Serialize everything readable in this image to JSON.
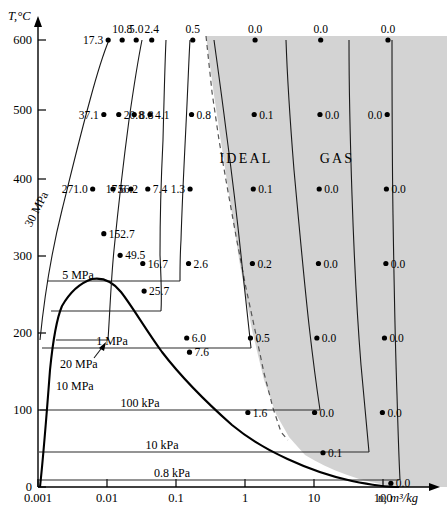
{
  "chart_data": {
    "type": "line",
    "title": "",
    "xlabel": "υ, m³/kg",
    "ylabel": "T,°C",
    "xscale": "log",
    "xlim": [
      0.001,
      300
    ],
    "ylim": [
      0,
      640
    ],
    "grid": false,
    "legend": "none",
    "x_ticks": [
      "0.001",
      "0.01",
      "0.1",
      "1",
      "10",
      "100"
    ],
    "y_ticks": [
      "0",
      "100",
      "200",
      "300",
      "400",
      "500",
      "600"
    ],
    "region_labels": [
      {
        "text": "IDEAL",
        "x": 3.2,
        "y": 440
      },
      {
        "text": "GAS",
        "x": 22,
        "y": 440
      }
    ],
    "shaded_region_note": "ideal-gas region shading",
    "isobar_labels": [
      {
        "text": "30 MPa",
        "rotated": true
      },
      {
        "text": "20 MPa",
        "rotated": false
      },
      {
        "text": "10 MPa",
        "rotated": false
      },
      {
        "text": "5 MPa",
        "rotated": false
      },
      {
        "text": "1 MPa",
        "rotated": false
      },
      {
        "text": "100 kPa",
        "rotated": false
      },
      {
        "text": "10 kPa",
        "rotated": false
      },
      {
        "text": "0.8 kPa",
        "rotated": false
      }
    ],
    "series": [
      {
        "name": "30 MPa",
        "values": [
          "17.3",
          "37.1",
          "271.0"
        ]
      },
      {
        "name": "20 MPa",
        "values": [
          "10.8",
          "20.8",
          "56.2",
          "152.7"
        ]
      },
      {
        "name": "10 MPa",
        "values": [
          "5.0",
          "8.8",
          "17.6",
          "49.5"
        ]
      },
      {
        "name": "5 MPa",
        "values": [
          "2.4",
          "4.1",
          "7.4",
          "16.7",
          "25.7"
        ]
      },
      {
        "name": "1 MPa",
        "values": [
          "0.5",
          "0.8",
          "1.3",
          "2.6",
          "6.0",
          "7.6"
        ]
      },
      {
        "name": "100 kPa",
        "values": [
          "0.0",
          "0.1",
          "0.1",
          "0.2",
          "0.5",
          "1.6"
        ]
      },
      {
        "name": "10 kPa",
        "values": [
          "0.0",
          "0.0",
          "0.0",
          "0.0",
          "0.0",
          "0.0",
          "0.1"
        ]
      },
      {
        "name": "0.8 kPa",
        "values": [
          "0.0",
          "0.0",
          "0.0",
          "0.0",
          "0.0",
          "0.0",
          "0.0"
        ]
      }
    ],
    "data_points": [
      {
        "label": "17.3",
        "x": 0.0104,
        "y": 600,
        "anchor": "end"
      },
      {
        "label": "10.8",
        "x": 0.0166,
        "y": 600,
        "anchor": "middle"
      },
      {
        "label": "5.0",
        "x": 0.0265,
        "y": 600,
        "anchor": "middle"
      },
      {
        "label": "2.4",
        "x": 0.0445,
        "y": 600,
        "anchor": "middle"
      },
      {
        "label": "0.5",
        "x": 0.175,
        "y": 600,
        "anchor": "middle"
      },
      {
        "label": "0.0",
        "x": 1.4,
        "y": 600,
        "anchor": "middle"
      },
      {
        "label": "0.0",
        "x": 12.5,
        "y": 600,
        "anchor": "middle"
      },
      {
        "label": "0.0",
        "x": 118,
        "y": 600,
        "anchor": "middle"
      },
      {
        "label": "37.1",
        "x": 0.009,
        "y": 500,
        "anchor": "end"
      },
      {
        "label": "20.8",
        "x": 0.0148,
        "y": 500,
        "anchor": "start"
      },
      {
        "label": "8.8",
        "x": 0.0248,
        "y": 500,
        "anchor": "start"
      },
      {
        "label": "4.1",
        "x": 0.042,
        "y": 500,
        "anchor": "start"
      },
      {
        "label": "0.8",
        "x": 0.168,
        "y": 500,
        "anchor": "start"
      },
      {
        "label": "0.1",
        "x": 1.36,
        "y": 500,
        "anchor": "start"
      },
      {
        "label": "0.0",
        "x": 12.2,
        "y": 500,
        "anchor": "start"
      },
      {
        "label": "0.0",
        "x": 115,
        "y": 500,
        "anchor": "end"
      },
      {
        "label": "271.0",
        "x": 0.0062,
        "y": 400,
        "anchor": "end"
      },
      {
        "label": "56.2",
        "x": 0.0122,
        "y": 400,
        "anchor": "start"
      },
      {
        "label": "17.6",
        "x": 0.0222,
        "y": 400,
        "anchor": "end"
      },
      {
        "label": "7.4",
        "x": 0.039,
        "y": 400,
        "anchor": "start"
      },
      {
        "label": "1.3",
        "x": 0.16,
        "y": 400,
        "anchor": "end"
      },
      {
        "label": "0.1",
        "x": 1.32,
        "y": 400,
        "anchor": "start"
      },
      {
        "label": "0.0",
        "x": 11.9,
        "y": 400,
        "anchor": "start"
      },
      {
        "label": "0.0",
        "x": 112,
        "y": 400,
        "anchor": "start"
      },
      {
        "label": "152.7",
        "x": 0.009,
        "y": 340,
        "anchor": "start"
      },
      {
        "label": "49.5",
        "x": 0.0155,
        "y": 311,
        "anchor": "start"
      },
      {
        "label": "16.7",
        "x": 0.033,
        "y": 300,
        "anchor": "start"
      },
      {
        "label": "2.6",
        "x": 0.152,
        "y": 300,
        "anchor": "start"
      },
      {
        "label": "0.2",
        "x": 1.28,
        "y": 300,
        "anchor": "start"
      },
      {
        "label": "0.0",
        "x": 11.6,
        "y": 300,
        "anchor": "start"
      },
      {
        "label": "0.0",
        "x": 110,
        "y": 300,
        "anchor": "start"
      },
      {
        "label": "25.7",
        "x": 0.0345,
        "y": 263,
        "anchor": "start"
      },
      {
        "label": "6.0",
        "x": 0.143,
        "y": 200,
        "anchor": "start"
      },
      {
        "label": "7.6",
        "x": 0.157,
        "y": 181,
        "anchor": "start"
      },
      {
        "label": "0.5",
        "x": 1.2,
        "y": 200,
        "anchor": "start"
      },
      {
        "label": "0.0",
        "x": 11.0,
        "y": 200,
        "anchor": "start"
      },
      {
        "label": "0.0",
        "x": 105,
        "y": 200,
        "anchor": "start"
      },
      {
        "label": "1.6",
        "x": 1.1,
        "y": 100,
        "anchor": "start"
      },
      {
        "label": "0.0",
        "x": 10.2,
        "y": 100,
        "anchor": "start"
      },
      {
        "label": "0.0",
        "x": 98,
        "y": 100,
        "anchor": "start"
      },
      {
        "label": "0.1",
        "x": 13.5,
        "y": 46,
        "anchor": "start"
      },
      {
        "label": "0.0",
        "x": 130,
        "y": 5,
        "anchor": "start"
      }
    ]
  }
}
